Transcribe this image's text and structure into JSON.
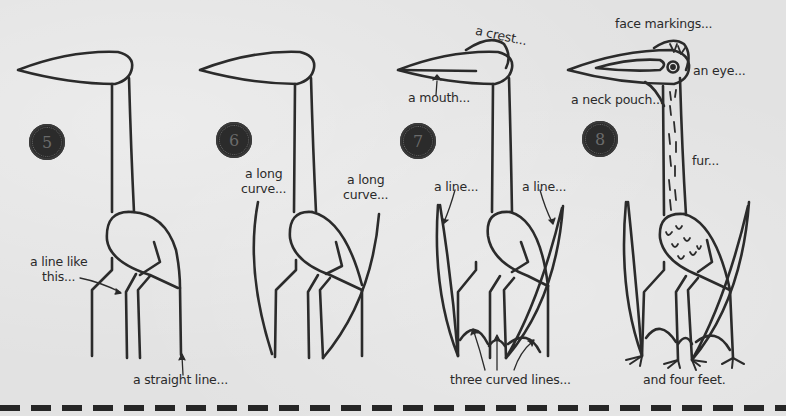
{
  "steps": [
    {
      "number": "5",
      "labels": {
        "line_like_this": "a line like\nthis...",
        "straight_line": "a straight line..."
      }
    },
    {
      "number": "6",
      "labels": {
        "long_curve_left": "a long\ncurve...",
        "long_curve_right": "a long\ncurve..."
      }
    },
    {
      "number": "7",
      "labels": {
        "crest": "a crest...",
        "mouth": "a mouth...",
        "line_left": "a line...",
        "line_right": "a line...",
        "three_curved_lines": "three curved lines..."
      }
    },
    {
      "number": "8",
      "labels": {
        "face_markings": "face markings...",
        "eye": "an eye...",
        "neck_pouch": "a neck pouch...",
        "fur": "fur...",
        "four_feet": "and four feet."
      }
    }
  ],
  "colors": {
    "background": "#e2e2e2",
    "ink": "#2b2b2b",
    "badge": "#2b2b2b"
  }
}
